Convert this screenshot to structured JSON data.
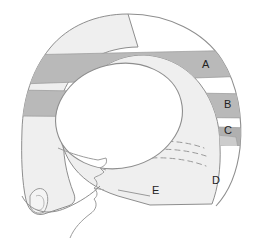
{
  "figure": {
    "background_color": "#ffffff",
    "outline_color": "#8a8a8a",
    "base_fill": "#efefef",
    "band_fill": "#b9b9b9",
    "band_fill_light": "#d0d0d0",
    "band_fill_dark": "#a8a8a8",
    "head_fill": "#ffffff",
    "dash_color": "#9a9a9a",
    "label_color": "#222222"
  },
  "labels": [
    {
      "id": "label-a",
      "text": "A",
      "x": 202,
      "y": 68
    },
    {
      "id": "label-b",
      "text": "B",
      "x": 224,
      "y": 108
    },
    {
      "id": "label-c",
      "text": "C",
      "x": 224,
      "y": 134
    },
    {
      "id": "label-d",
      "text": "D",
      "x": 212,
      "y": 184
    },
    {
      "id": "label-e",
      "text": "E",
      "x": 152,
      "y": 194
    }
  ]
}
